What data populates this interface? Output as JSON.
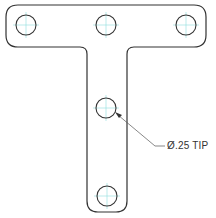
{
  "drawing": {
    "part": "T-shaped plate",
    "colors": {
      "outline": "#333333",
      "centerline": "#7fd6d6",
      "leader": "#555555",
      "background": "#ffffff"
    },
    "holes": [
      {
        "id": "top-left",
        "cx": 26,
        "cy": 25,
        "r": 10
      },
      {
        "id": "top-center",
        "cx": 106,
        "cy": 25,
        "r": 10
      },
      {
        "id": "top-right",
        "cx": 186,
        "cy": 25,
        "r": 10
      },
      {
        "id": "stem-middle",
        "cx": 106,
        "cy": 108,
        "r": 10
      },
      {
        "id": "stem-bottom",
        "cx": 107,
        "cy": 196,
        "r": 10
      }
    ],
    "callout": {
      "text": "Ø.25 TIP"
    }
  }
}
